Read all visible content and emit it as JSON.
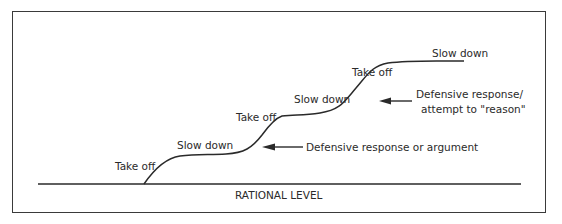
{
  "diagram": {
    "baseline_label": "RATIONAL LEVEL",
    "phase_labels": {
      "take_off_1": "Take off",
      "slow_down_1": "Slow down",
      "take_off_2": "Take off",
      "slow_down_2": "Slow down",
      "take_off_3": "Take off",
      "slow_down_3": "Slow down"
    },
    "annotations": {
      "lower": "Defensive response or argument",
      "upper_line1": "Defensive response/",
      "upper_line2": "attempt to \"reason\""
    },
    "colors": {
      "ink": "#2a2a2a",
      "border": "#3a3a3a",
      "background": "#ffffff"
    }
  }
}
